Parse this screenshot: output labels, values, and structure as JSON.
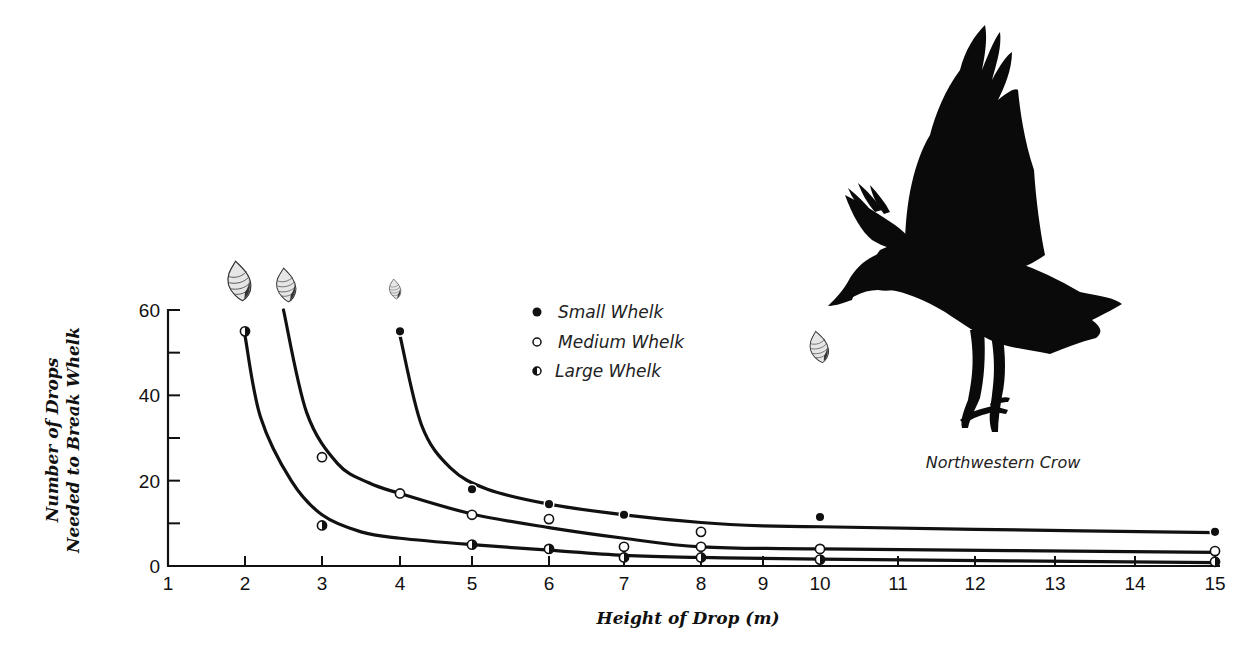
{
  "chart_data": {
    "type": "line",
    "title": "",
    "xlabel": "Height of Drop (m)",
    "ylabel": [
      "Number of Drops",
      "Needed to Break Whelk"
    ],
    "xlim": [
      1,
      15
    ],
    "ylim": [
      0,
      60
    ],
    "x_ticks": [
      1,
      2,
      3,
      4,
      5,
      6,
      7,
      8,
      9,
      10,
      11,
      12,
      13,
      14,
      15
    ],
    "y_ticks": [
      0,
      20,
      40,
      60
    ],
    "y_minor_ticks": [
      10,
      30,
      50
    ],
    "grid": false,
    "legend_position": "upper-center",
    "series": [
      {
        "name": "Small Whelk",
        "marker": "filled-circle",
        "points": [
          [
            4,
            55
          ],
          [
            5,
            18
          ],
          [
            6,
            14.5
          ],
          [
            7,
            12
          ],
          [
            10,
            11.5
          ],
          [
            15,
            8
          ]
        ],
        "curve": [
          [
            4,
            54
          ],
          [
            4.3,
            33
          ],
          [
            4.7,
            23
          ],
          [
            5.2,
            18
          ],
          [
            6,
            14.5
          ],
          [
            7,
            12
          ],
          [
            8,
            10.2
          ],
          [
            9,
            9.4
          ],
          [
            10,
            9.2
          ],
          [
            12,
            8.6
          ],
          [
            15,
            7.8
          ]
        ]
      },
      {
        "name": "Medium Whelk",
        "marker": "open-circle",
        "points": [
          [
            3,
            25.5
          ],
          [
            4,
            17
          ],
          [
            5,
            12
          ],
          [
            6,
            11
          ],
          [
            7,
            4.5
          ],
          [
            8,
            8
          ],
          [
            8,
            4.5
          ],
          [
            10,
            4
          ],
          [
            15,
            3.5
          ]
        ],
        "curve": [
          [
            2.5,
            60
          ],
          [
            2.8,
            36
          ],
          [
            3.2,
            24
          ],
          [
            3.6,
            19.5
          ],
          [
            4,
            17
          ],
          [
            5,
            12.2
          ],
          [
            6,
            9
          ],
          [
            7,
            6.5
          ],
          [
            8,
            4.5
          ],
          [
            10,
            4
          ],
          [
            15,
            3.2
          ]
        ]
      },
      {
        "name": "Large Whelk",
        "marker": "half-filled-circle",
        "points": [
          [
            2,
            55
          ],
          [
            3,
            9.5
          ],
          [
            5,
            5
          ],
          [
            6,
            4
          ],
          [
            7,
            2
          ],
          [
            8,
            2
          ],
          [
            10,
            1.5
          ],
          [
            15,
            1
          ]
        ],
        "curve": [
          [
            2,
            54
          ],
          [
            2.2,
            35
          ],
          [
            2.6,
            20
          ],
          [
            3,
            12
          ],
          [
            3.5,
            8
          ],
          [
            4,
            6.5
          ],
          [
            5,
            5
          ],
          [
            6,
            3.7
          ],
          [
            7,
            2.5
          ],
          [
            8,
            2
          ],
          [
            10,
            1.6
          ],
          [
            15,
            0.8
          ]
        ]
      }
    ],
    "annotations": [
      "Northwestern Crow"
    ]
  },
  "legend": {
    "items": [
      {
        "label": "Small Whelk",
        "marker": "filled-circle"
      },
      {
        "label": "Medium Whelk",
        "marker": "open-circle"
      },
      {
        "label": "Large Whelk",
        "marker": "half-filled-circle"
      }
    ]
  },
  "axes": {
    "x_title": "Height of Drop (m)",
    "y_title_line1": "Number of Drops",
    "y_title_line2": "Needed to Break Whelk"
  },
  "illustration": {
    "caption": "Northwestern Crow",
    "bird": "crow-silhouette",
    "shell_icons": [
      "whelk-shell-large",
      "whelk-shell-medium",
      "whelk-shell-small",
      "whelk-shell-falling"
    ]
  },
  "colors": {
    "ink": "#111111",
    "background": "#ffffff",
    "shell_fill": "#d8d8d8"
  }
}
